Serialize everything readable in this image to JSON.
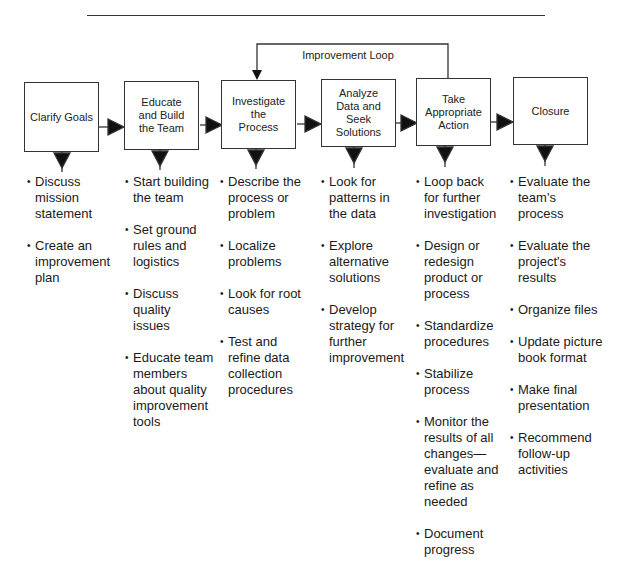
{
  "diagram": {
    "type": "process-flow",
    "loop": {
      "label": "Improvement Loop",
      "from_step": 5,
      "to_step": 3
    },
    "steps": [
      {
        "title": "Clarify Goals",
        "actions": [
          "Discuss mission statement",
          "Create an improvement plan"
        ]
      },
      {
        "title": "Educate\nand Build\nthe Team",
        "actions": [
          "Start building the team",
          "Set ground rules and logistics",
          "Discuss quality issues",
          "Educate team members about quality improvement tools"
        ]
      },
      {
        "title": "Investigate\nthe\nProcess",
        "actions": [
          "Describe the process or problem",
          "Localize problems",
          "Look for root causes",
          "Test and refine data collection procedures"
        ]
      },
      {
        "title": "Analyze\nData and Seek\nSolutions",
        "actions": [
          "Look for patterns in the data",
          "Explore alternative solutions",
          "Develop strategy for further improvement"
        ]
      },
      {
        "title": "Take\nAppropriate\nAction",
        "actions": [
          "Loop back for further investigation",
          "Design or redesign product or process",
          "Standardize procedures",
          "Stabilize process",
          "Monitor the results of all changes—evaluate and refine as needed",
          "Document progress"
        ]
      },
      {
        "title": "Closure",
        "actions": [
          "Evaluate the team's process",
          "Evaluate the project's results",
          "Organize files",
          "Update picture book format",
          "Make final presentation",
          "Recommend follow-up activities"
        ]
      }
    ]
  }
}
